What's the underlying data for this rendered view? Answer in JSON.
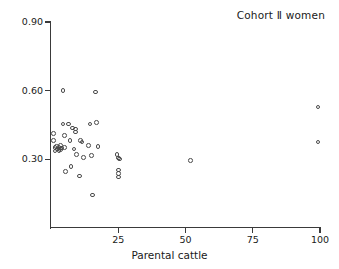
{
  "chart_data": {
    "type": "scatter",
    "title": "Cohort Ⅱ women",
    "xlabel": "Parental cattle",
    "ylabel": "Offspring",
    "xlim": [
      0,
      100
    ],
    "ylim": [
      0.0,
      0.9
    ],
    "xticks": [
      25,
      50,
      75,
      100
    ],
    "xtick_labels": [
      "25",
      "50",
      "75",
      "100"
    ],
    "yticks": [
      0.3,
      0.6,
      0.9
    ],
    "ytick_labels": [
      "0.30",
      "0.60",
      "0.90"
    ],
    "grid": false,
    "legend": false,
    "marker": "open-circle",
    "marker_color": "#4b4b4b",
    "points": [
      {
        "x": 1.0,
        "y": 0.413
      },
      {
        "x": 1.0,
        "y": 0.381
      },
      {
        "x": 1.5,
        "y": 0.352
      },
      {
        "x": 1.5,
        "y": 0.337
      },
      {
        "x": 2.0,
        "y": 0.357
      },
      {
        "x": 2.5,
        "y": 0.345
      },
      {
        "x": 3.0,
        "y": 0.352
      },
      {
        "x": 3.0,
        "y": 0.338
      },
      {
        "x": 3.5,
        "y": 0.361
      },
      {
        "x": 3.5,
        "y": 0.342
      },
      {
        "x": 4.0,
        "y": 0.349
      },
      {
        "x": 4.5,
        "y": 0.455
      },
      {
        "x": 4.5,
        "y": 0.601
      },
      {
        "x": 5.0,
        "y": 0.404
      },
      {
        "x": 5.0,
        "y": 0.352
      },
      {
        "x": 5.5,
        "y": 0.247
      },
      {
        "x": 6.5,
        "y": 0.455
      },
      {
        "x": 7.0,
        "y": 0.381
      },
      {
        "x": 7.5,
        "y": 0.268
      },
      {
        "x": 8.0,
        "y": 0.437
      },
      {
        "x": 8.5,
        "y": 0.345
      },
      {
        "x": 9.0,
        "y": 0.433
      },
      {
        "x": 9.0,
        "y": 0.419
      },
      {
        "x": 9.5,
        "y": 0.322
      },
      {
        "x": 10.5,
        "y": 0.228
      },
      {
        "x": 11.0,
        "y": 0.381
      },
      {
        "x": 11.5,
        "y": 0.375
      },
      {
        "x": 12.0,
        "y": 0.309
      },
      {
        "x": 14.0,
        "y": 0.361
      },
      {
        "x": 14.5,
        "y": 0.455
      },
      {
        "x": 15.0,
        "y": 0.318
      },
      {
        "x": 15.5,
        "y": 0.145
      },
      {
        "x": 16.5,
        "y": 0.594
      },
      {
        "x": 17.0,
        "y": 0.46
      },
      {
        "x": 17.5,
        "y": 0.357
      },
      {
        "x": 24.5,
        "y": 0.322
      },
      {
        "x": 25.0,
        "y": 0.305
      },
      {
        "x": 25.5,
        "y": 0.302
      },
      {
        "x": 25.0,
        "y": 0.253
      },
      {
        "x": 25.0,
        "y": 0.238
      },
      {
        "x": 25.0,
        "y": 0.222
      },
      {
        "x": 51.8,
        "y": 0.295
      },
      {
        "x": 99.2,
        "y": 0.529
      },
      {
        "x": 99.2,
        "y": 0.375
      }
    ]
  },
  "axes": {
    "y_labels": [
      "0.90",
      "0.60",
      "0.30"
    ],
    "x_labels": [
      "25",
      "50",
      "75",
      "100"
    ],
    "x_title": "Parental cattle",
    "y_title": "Offspring"
  }
}
